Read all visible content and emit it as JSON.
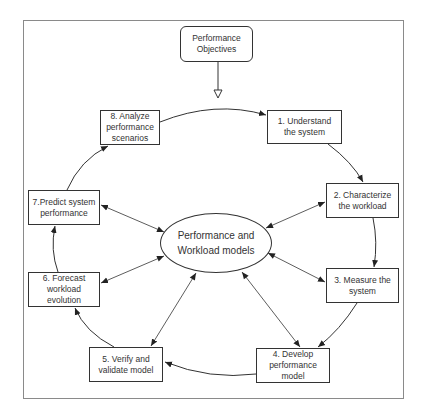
{
  "diagram": {
    "source_node": {
      "id": "objectives",
      "label": "Performance\nObjectives"
    },
    "center_node": {
      "id": "models",
      "label": "Performance and\nWorkload models"
    },
    "cycle_nodes": [
      {
        "id": "step1",
        "label": "1. Understand\nthe system"
      },
      {
        "id": "step2",
        "label": "2. Characterize\nthe workload"
      },
      {
        "id": "step3",
        "label": "3. Measure the\nsystem"
      },
      {
        "id": "step4",
        "label": "4. Develop\nperformance model"
      },
      {
        "id": "step5",
        "label": "5. Verify and\nvalidate model"
      },
      {
        "id": "step6",
        "label": "6. Forecast\nworkload evolution"
      },
      {
        "id": "step7",
        "label": "7.Predict system\nperformance"
      },
      {
        "id": "step8",
        "label": "8. Analyze\nperformance\nscenarios"
      }
    ],
    "edges": [
      {
        "from": "objectives",
        "to": "cycle",
        "style": "hollow-arrow"
      },
      {
        "from": "step8",
        "to": "step1",
        "style": "curved-arrow"
      },
      {
        "from": "step1",
        "to": "step2",
        "style": "curved-arrow"
      },
      {
        "from": "step2",
        "to": "step3",
        "style": "curved-arrow"
      },
      {
        "from": "step3",
        "to": "step4",
        "style": "curved-arrow"
      },
      {
        "from": "step4",
        "to": "step5",
        "style": "curved-arrow"
      },
      {
        "from": "step5",
        "to": "step6",
        "style": "curved-arrow"
      },
      {
        "from": "step6",
        "to": "step7",
        "style": "curved-arrow"
      },
      {
        "from": "step7",
        "to": "step8",
        "style": "curved-arrow"
      },
      {
        "from": "models",
        "to": "step2",
        "style": "bidirectional"
      },
      {
        "from": "models",
        "to": "step3",
        "style": "bidirectional"
      },
      {
        "from": "models",
        "to": "step4",
        "style": "bidirectional"
      },
      {
        "from": "models",
        "to": "step5",
        "style": "bidirectional"
      },
      {
        "from": "models",
        "to": "step6",
        "style": "bidirectional"
      },
      {
        "from": "models",
        "to": "step7",
        "style": "bidirectional"
      }
    ],
    "colors": {
      "line": "#333333",
      "frame": "#8a8a8a",
      "background": "#ffffff"
    }
  }
}
